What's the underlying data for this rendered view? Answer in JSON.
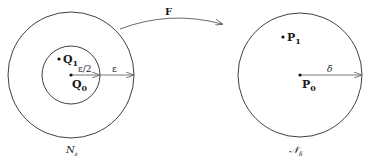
{
  "figure": {
    "map_label": "F",
    "left": {
      "set_label": "N",
      "set_subscript": "ε",
      "inner_radius_label": "ε/2",
      "outer_radius_label": "ε",
      "points": [
        {
          "name": "Q",
          "sub": "0"
        },
        {
          "name": "Q",
          "sub": "1"
        }
      ]
    },
    "right": {
      "set_label": "𝒩",
      "set_subscript": "δ",
      "radius_label": "δ",
      "points": [
        {
          "name": "P",
          "sub": "0"
        },
        {
          "name": "P",
          "sub": "1"
        }
      ]
    },
    "colors": {
      "stroke": "#2a2a2a",
      "background": "#ffffff"
    }
  }
}
